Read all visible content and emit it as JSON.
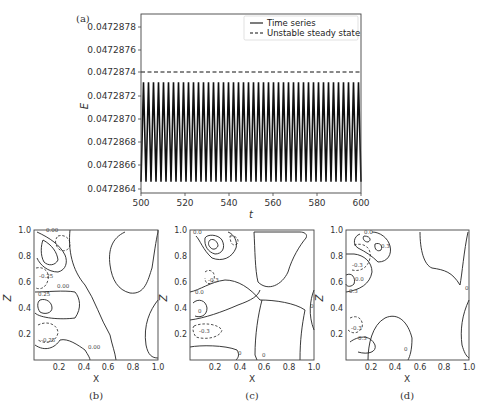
{
  "figure": {
    "panels": [
      "(a)",
      "(b)",
      "(c)",
      "(d)"
    ]
  },
  "chart_data": [
    {
      "type": "line",
      "panel": "(a)",
      "title": "",
      "xlabel": "t",
      "ylabel": "E",
      "xlim": [
        500,
        600
      ],
      "ylim": [
        0.04728635,
        0.04728795
      ],
      "xticks": [
        500,
        520,
        540,
        560,
        580,
        600
      ],
      "yticks": [
        "0.0472864",
        "0.0472866",
        "0.0472868",
        "0.0472870",
        "0.0472872",
        "0.0472874",
        "0.0472876",
        "0.0472878"
      ],
      "grid": false,
      "legend_position": "upper right",
      "series": [
        {
          "name": "Time series",
          "style": "solid",
          "description": "Periodic oscillation between min and max",
          "min": 0.04728645,
          "max": 0.04728734,
          "period_approx": 2.27,
          "num_cycles_in_window": 44
        },
        {
          "name": "Unstable steady state",
          "style": "dashed",
          "value": 0.04728742
        }
      ]
    },
    {
      "type": "contour",
      "panel": "(b)",
      "xlabel": "X",
      "ylabel": "Z",
      "xlim": [
        0,
        1.0
      ],
      "ylim": [
        0,
        1.0
      ],
      "xticks": [
        "0.2",
        "0.4",
        "0.6",
        "0.8",
        "1.0"
      ],
      "yticks": [
        "0.2",
        "0.4",
        "0.6",
        "0.8",
        "1.0"
      ],
      "contour_labels": [
        "0.00",
        "-0.25",
        "0.25",
        "0.00",
        "-0.25",
        "0.25",
        "0.00"
      ]
    },
    {
      "type": "contour",
      "panel": "(c)",
      "xlabel": "X",
      "ylabel": "Z",
      "xlim": [
        0,
        1.0
      ],
      "ylim": [
        0,
        1.0
      ],
      "xticks": [
        "0.2",
        "0.4",
        "0.6",
        "0.8",
        "1.0"
      ],
      "yticks": [
        "0.2",
        "0.4",
        "0.6",
        "0.8",
        "1.0"
      ],
      "contour_labels": [
        "0.0",
        "-0.3",
        "0.0",
        "0",
        "-0.3",
        "0.0",
        "0",
        "0",
        "0"
      ]
    },
    {
      "type": "contour",
      "panel": "(d)",
      "xlabel": "X",
      "ylabel": "Z",
      "xlim": [
        0,
        1.0
      ],
      "ylim": [
        0,
        1.0
      ],
      "xticks": [
        "0.2",
        "0.4",
        "0.6",
        "0.8",
        "1.0"
      ],
      "yticks": [
        "0.2",
        "0.4",
        "0.6",
        "0.8",
        "1.0"
      ],
      "contour_labels": [
        "0.0",
        "0.3",
        "-0.3",
        "0.0",
        "0.3",
        "-0.3",
        "0.3",
        "0",
        "0",
        "0"
      ]
    }
  ],
  "labels": {
    "a": "(a)",
    "b": "(b)",
    "c": "(c)",
    "d": "(d)",
    "ylabel_a": "E",
    "xlabel_a": "t",
    "xlabel_contour": "X",
    "ylabel_contour": "Z",
    "legend_solid": "Time series",
    "legend_dashed": "Unstable steady state",
    "yticks_a": [
      "0.0472878",
      "0.0472876",
      "0.0472874",
      "0.0472872",
      "0.0472870",
      "0.0472868",
      "0.0472866",
      "0.0472864"
    ],
    "xticks_a": [
      "500",
      "520",
      "540",
      "560",
      "580",
      "600"
    ],
    "xticks_c": [
      "0.2",
      "0.4",
      "0.6",
      "0.8",
      "1.0"
    ],
    "yticks_c": [
      "1.0",
      "0.8",
      "0.6",
      "0.4",
      "0.2"
    ],
    "cl_b": [
      "0.00",
      "-0.25",
      "0.25",
      "0.00",
      "-0.25",
      "0.00"
    ],
    "cl_c": [
      "0.0",
      "-0.3",
      "0.0",
      "0",
      "-0.3",
      "0",
      "0",
      "0"
    ],
    "cl_d": [
      "0.0",
      "0.3",
      "-0.3",
      "0.0",
      "0.3",
      "-0.3",
      "0.3",
      "0",
      "0"
    ]
  }
}
